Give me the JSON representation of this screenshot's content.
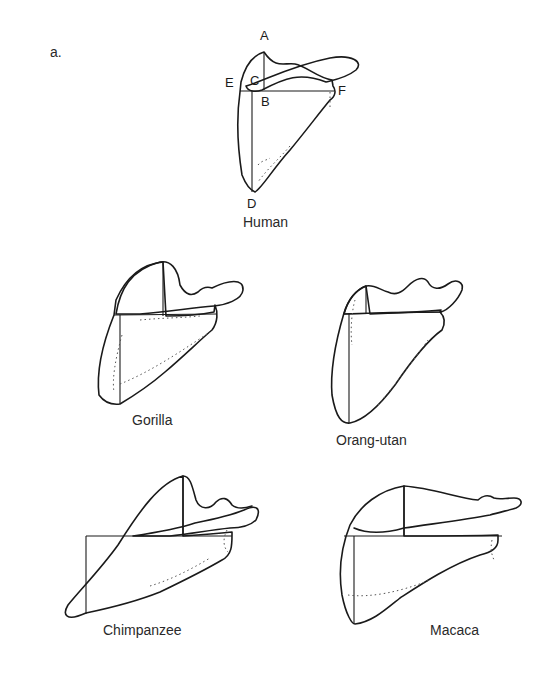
{
  "figure": {
    "panel_label": "a.",
    "specimens": [
      {
        "id": "human",
        "name": "Human",
        "measurement_points": [
          "A",
          "B",
          "C",
          "D",
          "E",
          "F"
        ]
      },
      {
        "id": "gorilla",
        "name": "Gorilla"
      },
      {
        "id": "orangutan",
        "name": "Orang-utan"
      },
      {
        "id": "chimpanzee",
        "name": "Chimpanzee"
      },
      {
        "id": "macaca",
        "name": "Macaca"
      }
    ],
    "human_points": {
      "A": "A",
      "B": "B",
      "C": "C",
      "D": "D",
      "E": "E",
      "F": "F"
    }
  }
}
